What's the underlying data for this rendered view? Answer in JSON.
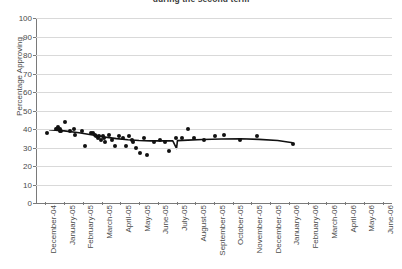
{
  "chart_data": {
    "type": "scatter",
    "title": "during the second term",
    "xlabel": "",
    "ylabel": "Percentage Approving",
    "ylim": [
      0,
      100
    ],
    "ytick_step": 10,
    "yticks": [
      0,
      10,
      20,
      30,
      40,
      50,
      60,
      70,
      80,
      90,
      100
    ],
    "grid": true,
    "legend": "none",
    "categories": [
      "December-04",
      "January-05",
      "February-05",
      "March-05",
      "April-05",
      "May-05",
      "June-05",
      "July-05",
      "August-05",
      "September-05",
      "October-05",
      "November-05",
      "December-05",
      "January-06",
      "February-06",
      "March-06",
      "April-06",
      "May-06",
      "June-06"
    ],
    "series": [
      {
        "name": "Percentage Approving",
        "marker": "circle",
        "color": "#111111",
        "points": [
          {
            "x": 0.1,
            "y": 38
          },
          {
            "x": 0.55,
            "y": 40
          },
          {
            "x": 0.62,
            "y": 40
          },
          {
            "x": 0.7,
            "y": 41
          },
          {
            "x": 0.76,
            "y": 40
          },
          {
            "x": 0.8,
            "y": 39
          },
          {
            "x": 0.86,
            "y": 39
          },
          {
            "x": 1.05,
            "y": 44
          },
          {
            "x": 1.3,
            "y": 39
          },
          {
            "x": 1.55,
            "y": 40
          },
          {
            "x": 1.6,
            "y": 37
          },
          {
            "x": 1.95,
            "y": 39
          },
          {
            "x": 2.1,
            "y": 31
          },
          {
            "x": 2.45,
            "y": 38
          },
          {
            "x": 2.55,
            "y": 38
          },
          {
            "x": 2.65,
            "y": 37
          },
          {
            "x": 2.72,
            "y": 36
          },
          {
            "x": 2.8,
            "y": 35
          },
          {
            "x": 2.88,
            "y": 36
          },
          {
            "x": 2.95,
            "y": 34
          },
          {
            "x": 3.05,
            "y": 36
          },
          {
            "x": 3.12,
            "y": 35
          },
          {
            "x": 3.2,
            "y": 33
          },
          {
            "x": 3.4,
            "y": 37
          },
          {
            "x": 3.55,
            "y": 34
          },
          {
            "x": 3.7,
            "y": 31
          },
          {
            "x": 3.95,
            "y": 36
          },
          {
            "x": 4.15,
            "y": 35
          },
          {
            "x": 4.3,
            "y": 31
          },
          {
            "x": 4.45,
            "y": 36
          },
          {
            "x": 4.6,
            "y": 34
          },
          {
            "x": 4.7,
            "y": 33
          },
          {
            "x": 4.85,
            "y": 30
          },
          {
            "x": 5.05,
            "y": 27
          },
          {
            "x": 5.25,
            "y": 35
          },
          {
            "x": 5.45,
            "y": 26
          },
          {
            "x": 5.8,
            "y": 33
          },
          {
            "x": 6.1,
            "y": 34
          },
          {
            "x": 6.4,
            "y": 33
          },
          {
            "x": 6.6,
            "y": 28
          },
          {
            "x": 6.95,
            "y": 35
          },
          {
            "x": 7.3,
            "y": 35
          },
          {
            "x": 7.6,
            "y": 40
          },
          {
            "x": 7.95,
            "y": 35
          },
          {
            "x": 8.45,
            "y": 34
          },
          {
            "x": 9.05,
            "y": 36
          },
          {
            "x": 9.55,
            "y": 37
          },
          {
            "x": 10.4,
            "y": 34
          },
          {
            "x": 11.3,
            "y": 36
          },
          {
            "x": 13.2,
            "y": 32
          }
        ]
      }
    ],
    "trendline": {
      "type": "smoothed-line",
      "color": "#111111",
      "points": [
        {
          "x": 0.2,
          "y": 39.6
        },
        {
          "x": 1.0,
          "y": 39.0
        },
        {
          "x": 1.8,
          "y": 38.0
        },
        {
          "x": 2.6,
          "y": 36.6
        },
        {
          "x": 3.2,
          "y": 35.6
        },
        {
          "x": 3.8,
          "y": 34.8
        },
        {
          "x": 4.4,
          "y": 34.2
        },
        {
          "x": 5.0,
          "y": 33.8
        },
        {
          "x": 5.6,
          "y": 33.6
        },
        {
          "x": 6.2,
          "y": 33.6
        },
        {
          "x": 6.8,
          "y": 33.6
        },
        {
          "x": 7.0,
          "y": 29.5
        },
        {
          "x": 7.05,
          "y": 33.7
        },
        {
          "x": 7.6,
          "y": 34.0
        },
        {
          "x": 8.4,
          "y": 34.3
        },
        {
          "x": 9.4,
          "y": 34.6
        },
        {
          "x": 10.4,
          "y": 34.7
        },
        {
          "x": 11.4,
          "y": 34.4
        },
        {
          "x": 12.4,
          "y": 33.8
        },
        {
          "x": 13.2,
          "y": 32.6
        }
      ]
    }
  }
}
